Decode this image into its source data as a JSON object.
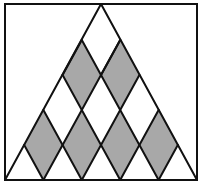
{
  "diagram": {
    "title": "",
    "colors": {
      "background": "#ffffff",
      "line": "#111111",
      "shaded": "#a8a8a8"
    },
    "frame": {
      "x": 5,
      "y": 4,
      "width": 192,
      "height": 176
    },
    "triangle": {
      "apex": [
        101,
        4
      ],
      "base_left": [
        5,
        180
      ],
      "base_right": [
        197,
        180
      ]
    },
    "grid": {
      "base_segments": 5,
      "levels": 5
    },
    "shaded_rhombi": [
      {
        "top": [
          81.8,
          40
        ],
        "right": [
          101,
          75
        ],
        "bottom": [
          81.8,
          110
        ],
        "left": [
          62.6,
          75
        ]
      },
      {
        "top": [
          120.2,
          40
        ],
        "right": [
          139.4,
          75
        ],
        "bottom": [
          120.2,
          110
        ],
        "left": [
          101,
          75
        ]
      },
      {
        "top": [
          43.4,
          110
        ],
        "right": [
          62.6,
          145
        ],
        "bottom": [
          43.4,
          180
        ],
        "left": [
          24.2,
          145
        ]
      },
      {
        "top": [
          81.8,
          110
        ],
        "right": [
          101,
          145
        ],
        "bottom": [
          81.8,
          180
        ],
        "left": [
          62.6,
          145
        ]
      },
      {
        "top": [
          120.2,
          110
        ],
        "right": [
          139.4,
          145
        ],
        "bottom": [
          120.2,
          180
        ],
        "left": [
          101,
          145
        ]
      },
      {
        "top": [
          158.6,
          110
        ],
        "right": [
          177.8,
          145
        ],
        "bottom": [
          158.6,
          180
        ],
        "left": [
          139.4,
          145
        ]
      }
    ],
    "lattice_lines": [
      [
        [
          5,
          180
        ],
        [
          101,
          4
        ]
      ],
      [
        [
          197,
          180
        ],
        [
          101,
          4
        ]
      ],
      [
        [
          5,
          180
        ],
        [
          197,
          180
        ]
      ],
      [
        [
          43.4,
          180
        ],
        [
          120.2,
          40
        ]
      ],
      [
        [
          81.8,
          180
        ],
        [
          139.4,
          75
        ]
      ],
      [
        [
          120.2,
          180
        ],
        [
          158.6,
          110
        ]
      ],
      [
        [
          158.6,
          180
        ],
        [
          177.8,
          145
        ]
      ],
      [
        [
          158.6,
          180
        ],
        [
          81.8,
          40
        ]
      ],
      [
        [
          120.2,
          180
        ],
        [
          62.6,
          75
        ]
      ],
      [
        [
          81.8,
          180
        ],
        [
          43.4,
          110
        ]
      ],
      [
        [
          43.4,
          180
        ],
        [
          24.2,
          145
        ]
      ],
      [
        [
          62.6,
          75
        ],
        [
          81.8,
          40
        ]
      ],
      [
        [
          101,
          75
        ],
        [
          120.2,
          40
        ]
      ]
    ]
  }
}
